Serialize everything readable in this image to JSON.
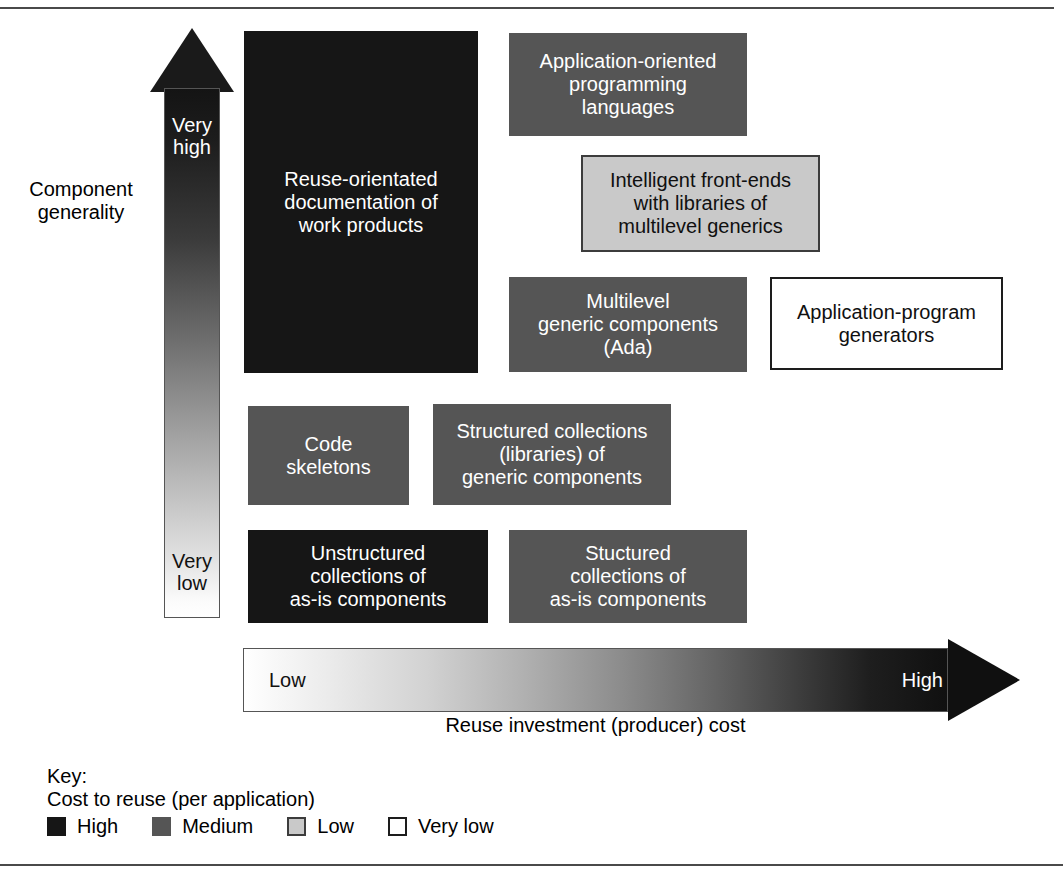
{
  "axes": {
    "y": {
      "title": "Component\ngenerality",
      "title_line1": "Component",
      "title_line2": "generality",
      "top_label": "Very\nhigh",
      "top_label_line1": "Very",
      "top_label_line2": "high",
      "bottom_label": "Very\nlow",
      "bottom_label_line1": "Very",
      "bottom_label_line2": "low",
      "direction": "up",
      "gradient_from": "#ffffff",
      "gradient_to": "#141414"
    },
    "x": {
      "title": "Reuse investment (producer) cost",
      "low_label": "Low",
      "high_label": "High",
      "direction": "right",
      "gradient_from": "#ffffff",
      "gradient_to": "#101010"
    }
  },
  "cells": [
    {
      "id": "reuse-orientated-documentation",
      "text": "Reuse-orientated\ndocumentation of\nwork products",
      "cost_to_reuse": "High",
      "fill": "#161616",
      "text_color": "#ffffff"
    },
    {
      "id": "application-oriented-programming-languages",
      "text": "Application-oriented\nprogramming\nlanguages",
      "cost_to_reuse": "Medium",
      "fill": "#555555",
      "text_color": "#ffffff"
    },
    {
      "id": "intelligent-front-ends",
      "text": "Intelligent front-ends\nwith libraries of\nmultilevel generics",
      "cost_to_reuse": "Low",
      "fill": "#c9c9c9",
      "text_color": "#101010"
    },
    {
      "id": "multilevel-generic-components",
      "text": "Multilevel\ngeneric components\n(Ada)",
      "cost_to_reuse": "Medium",
      "fill": "#555555",
      "text_color": "#ffffff"
    },
    {
      "id": "application-program-generators",
      "text": "Application-program\ngenerators",
      "cost_to_reuse": "Very low",
      "fill": "#ffffff",
      "text_color": "#101010"
    },
    {
      "id": "code-skeletons",
      "text": "Code\nskeletons",
      "cost_to_reuse": "Medium",
      "fill": "#555555",
      "text_color": "#ffffff"
    },
    {
      "id": "structured-collections-libraries",
      "text": "Structured collections\n(libraries) of\ngeneric components",
      "cost_to_reuse": "Medium",
      "fill": "#555555",
      "text_color": "#ffffff"
    },
    {
      "id": "unstructured-collections-as-is",
      "text": "Unstructured\ncollections of\nas-is components",
      "cost_to_reuse": "High",
      "fill": "#161616",
      "text_color": "#ffffff"
    },
    {
      "id": "stuctured-collections-as-is",
      "text": "Stuctured\ncollections of\nas-is components",
      "cost_to_reuse": "Medium",
      "fill": "#555555",
      "text_color": "#ffffff"
    }
  ],
  "key": {
    "title": "Key:",
    "subtitle": "Cost to reuse (per application)",
    "entries": [
      {
        "label": "High",
        "color": "#161616"
      },
      {
        "label": "Medium",
        "color": "#555555"
      },
      {
        "label": "Low",
        "color": "#c9c9c9"
      },
      {
        "label": "Very  low",
        "color": "#ffffff"
      }
    ]
  }
}
